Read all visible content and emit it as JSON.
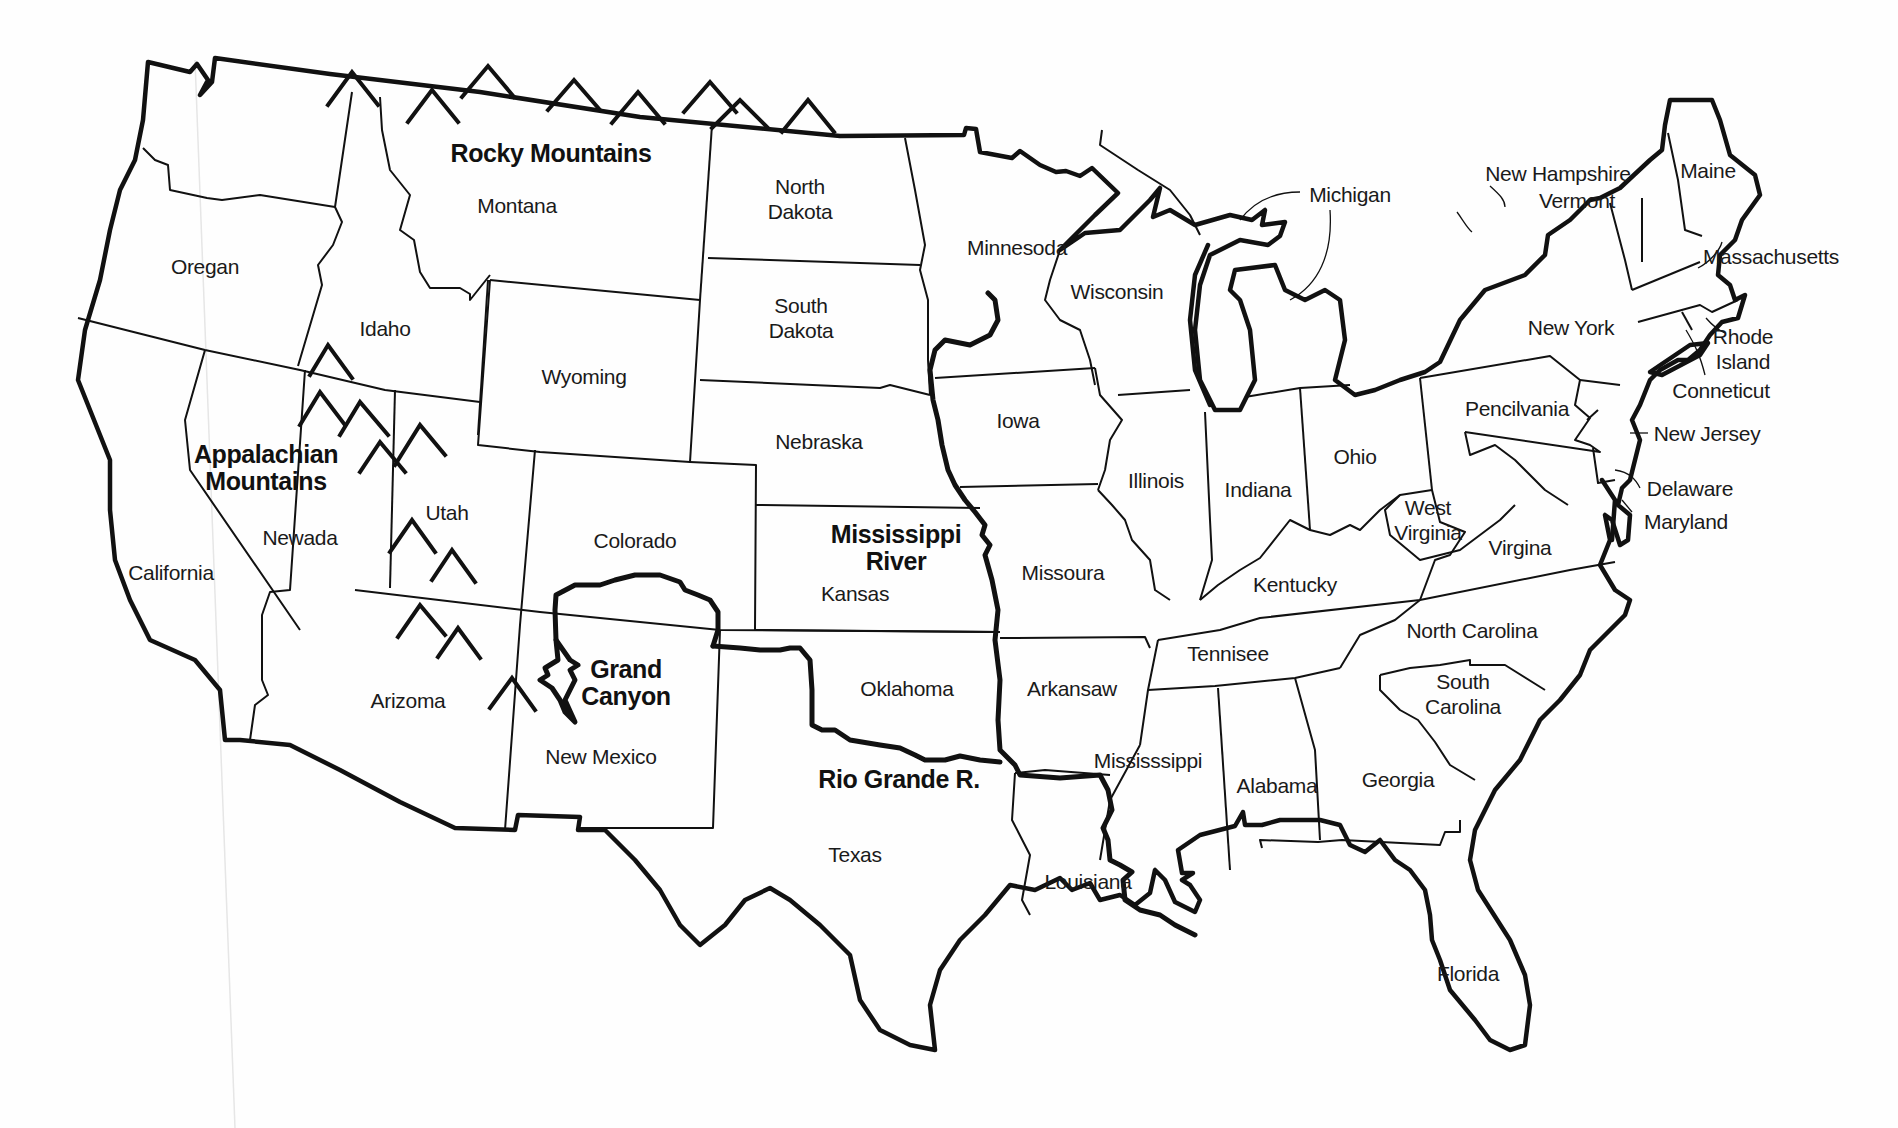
{
  "map": {
    "type": "US outline map with states and geographic features",
    "stroke_color": "#111111",
    "background_color": "#ffffff"
  },
  "states": [
    {
      "id": "oregan",
      "label": "Oregan",
      "x": 205,
      "y": 266
    },
    {
      "id": "california",
      "label": "California",
      "x": 171,
      "y": 572
    },
    {
      "id": "newada",
      "label": "Newada",
      "x": 300,
      "y": 537
    },
    {
      "id": "idaho",
      "label": "Idaho",
      "x": 385,
      "y": 328
    },
    {
      "id": "montana",
      "label": "Montana",
      "x": 517,
      "y": 205
    },
    {
      "id": "wyoming",
      "label": "Wyoming",
      "x": 584,
      "y": 376
    },
    {
      "id": "utah",
      "label": "Utah",
      "x": 447,
      "y": 512
    },
    {
      "id": "colorado",
      "label": "Colorado",
      "x": 635,
      "y": 540
    },
    {
      "id": "arizoma",
      "label": "Arizoma",
      "x": 408,
      "y": 700
    },
    {
      "id": "new-mexico",
      "label": "New Mexico",
      "x": 601,
      "y": 756
    },
    {
      "id": "north-dakota",
      "label": "North\nDakota",
      "x": 800,
      "y": 199
    },
    {
      "id": "south-dakota",
      "label": "South\nDakota",
      "x": 801,
      "y": 318
    },
    {
      "id": "nebraska",
      "label": "Nebraska",
      "x": 819,
      "y": 441
    },
    {
      "id": "kansas",
      "label": "Kansas",
      "x": 855,
      "y": 593
    },
    {
      "id": "oklahoma",
      "label": "Oklahoma",
      "x": 907,
      "y": 688
    },
    {
      "id": "texas",
      "label": "Texas",
      "x": 855,
      "y": 854
    },
    {
      "id": "minnesoda",
      "label": "Minnesoda",
      "x": 1017,
      "y": 247
    },
    {
      "id": "iowa",
      "label": "Iowa",
      "x": 1018,
      "y": 420
    },
    {
      "id": "missoura",
      "label": "Missoura",
      "x": 1063,
      "y": 572
    },
    {
      "id": "arkansaw",
      "label": "Arkansaw",
      "x": 1072,
      "y": 688
    },
    {
      "id": "louisiana",
      "label": "Louisiana",
      "x": 1088,
      "y": 881
    },
    {
      "id": "wisconsin",
      "label": "Wisconsin",
      "x": 1117,
      "y": 291
    },
    {
      "id": "illinois",
      "label": "Illinois",
      "x": 1156,
      "y": 480
    },
    {
      "id": "indiana",
      "label": "Indiana",
      "x": 1258,
      "y": 489
    },
    {
      "id": "ohio",
      "label": "Ohio",
      "x": 1355,
      "y": 456
    },
    {
      "id": "kentucky",
      "label": "Kentucky",
      "x": 1295,
      "y": 584
    },
    {
      "id": "tennisee",
      "label": "Tennisee",
      "x": 1228,
      "y": 653
    },
    {
      "id": "mississsippi",
      "label": "Mississsippi",
      "x": 1148,
      "y": 760
    },
    {
      "id": "alabama",
      "label": "Alabama",
      "x": 1277,
      "y": 785
    },
    {
      "id": "georgia",
      "label": "Georgia",
      "x": 1398,
      "y": 779
    },
    {
      "id": "florida",
      "label": "Florida",
      "x": 1468,
      "y": 973
    },
    {
      "id": "south-carolina",
      "label": "South\nCarolina",
      "x": 1463,
      "y": 694
    },
    {
      "id": "north-carolina",
      "label": "North Carolina",
      "x": 1472,
      "y": 630
    },
    {
      "id": "virgina",
      "label": "Virgina",
      "x": 1520,
      "y": 547
    },
    {
      "id": "west-virginia",
      "label": "West\nVirginia",
      "x": 1428,
      "y": 520
    },
    {
      "id": "pencilvania",
      "label": "Pencilvania",
      "x": 1517,
      "y": 408
    },
    {
      "id": "new-york",
      "label": "New York",
      "x": 1571,
      "y": 327
    },
    {
      "id": "michigan",
      "label": "Michigan",
      "x": 1350,
      "y": 194
    },
    {
      "id": "new-hampshire",
      "label": "New Hampshire",
      "x": 1558,
      "y": 173
    },
    {
      "id": "vermont",
      "label": "Vermont",
      "x": 1577,
      "y": 200
    },
    {
      "id": "maine",
      "label": "Maine",
      "x": 1708,
      "y": 170
    },
    {
      "id": "massachusetts",
      "label": "Massachusetts",
      "x": 1771,
      "y": 256
    },
    {
      "id": "rhode-island",
      "label": "Rhode\nIsland",
      "x": 1743,
      "y": 349
    },
    {
      "id": "conneticut",
      "label": "Conneticut",
      "x": 1721,
      "y": 390
    },
    {
      "id": "new-jersey",
      "label": "New Jersey",
      "x": 1707,
      "y": 433
    },
    {
      "id": "delaware",
      "label": "Delaware",
      "x": 1690,
      "y": 488
    },
    {
      "id": "maryland",
      "label": "Maryland",
      "x": 1686,
      "y": 521
    }
  ],
  "features": [
    {
      "id": "rocky-mountains",
      "label": "Rocky Mountains",
      "x": 551,
      "y": 153
    },
    {
      "id": "appalachian-mountains",
      "label": "Appalachian\nMountains",
      "x": 266,
      "y": 468
    },
    {
      "id": "mississippi-river",
      "label": "Mississippi\nRiver",
      "x": 896,
      "y": 548
    },
    {
      "id": "grand-canyon",
      "label": "Grand\nCanyon",
      "x": 626,
      "y": 683
    },
    {
      "id": "rio-grande",
      "label": "Rio Grande R.",
      "x": 899,
      "y": 779
    }
  ]
}
